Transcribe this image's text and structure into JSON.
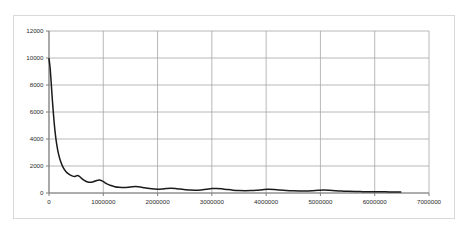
{
  "chart_data": {
    "type": "line",
    "title": "",
    "subtitle": "",
    "xlabel": "",
    "ylabel": "",
    "xlim": [
      0,
      7000000
    ],
    "ylim": [
      0,
      12000
    ],
    "grid": true,
    "legend": false,
    "legend_position": "none",
    "series_color": "#1a1a1a",
    "grid_color": "#a6a6a6",
    "axis_color": "#808080",
    "frame_color": "#d9d9d9",
    "background_color": "#ffffff",
    "y_ticks": [
      0,
      2000,
      4000,
      6000,
      8000,
      10000,
      12000
    ],
    "y_tick_labels": [
      "0",
      "2000",
      "4000",
      "6000",
      "8000",
      "10000",
      "12000"
    ],
    "x_ticks": [
      0,
      1000000,
      2000000,
      3000000,
      4000000,
      5000000,
      6000000,
      7000000
    ],
    "x_tick_labels": [
      "0",
      "1000000",
      "2000000",
      "3000000",
      "4000000",
      "5000000",
      "6000000",
      "7000000"
    ],
    "series": [
      {
        "name": "series-1",
        "x": [
          0,
          20000,
          40000,
          60000,
          85000,
          110000,
          140000,
          175000,
          215000,
          260000,
          310000,
          365000,
          425000,
          480000,
          520000,
          560000,
          600000,
          650000,
          700000,
          760000,
          820000,
          880000,
          930000,
          975000,
          1020000,
          1075000,
          1140000,
          1210000,
          1290000,
          1380000,
          1460000,
          1530000,
          1600000,
          1680000,
          1760000,
          1850000,
          1940000,
          2020000,
          2090000,
          2160000,
          2240000,
          2330000,
          2420000,
          2510000,
          2600000,
          2700000,
          2800000,
          2900000,
          3000000,
          3090000,
          3180000,
          3280000,
          3390000,
          3500000,
          3610000,
          3720000,
          3830000,
          3940000,
          4040000,
          4140000,
          4250000,
          4370000,
          4490000,
          4610000,
          4730000,
          4850000,
          4960000,
          5060000,
          5160000,
          5270000,
          5390000,
          5510000,
          5640000,
          5780000,
          5920000,
          6060000,
          6200000,
          6340000,
          6480000
        ],
        "y": [
          9950,
          9300,
          8200,
          7000,
          5700,
          4600,
          3650,
          2900,
          2330,
          1900,
          1600,
          1400,
          1270,
          1230,
          1290,
          1230,
          1080,
          930,
          830,
          790,
          840,
          930,
          960,
          900,
          790,
          660,
          550,
          470,
          420,
          400,
          420,
          460,
          480,
          450,
          390,
          330,
          290,
          280,
          300,
          330,
          350,
          330,
          290,
          250,
          220,
          210,
          230,
          280,
          330,
          340,
          310,
          260,
          210,
          180,
          170,
          180,
          210,
          250,
          275,
          260,
          220,
          185,
          160,
          150,
          155,
          175,
          200,
          215,
          200,
          170,
          145,
          125,
          110,
          100,
          95,
          90,
          85,
          80,
          70
        ]
      }
    ]
  }
}
